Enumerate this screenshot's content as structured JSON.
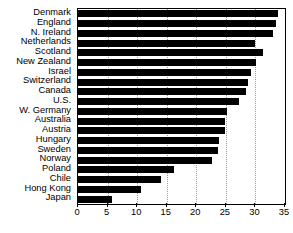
{
  "chart_data": {
    "type": "bar",
    "orientation": "horizontal",
    "title": "",
    "subtitle": "",
    "xlabel": "",
    "ylabel": "",
    "xlim": [
      0,
      35
    ],
    "ylim": null,
    "xticks": [
      0,
      5,
      10,
      15,
      20,
      25,
      30,
      35
    ],
    "xtick_labels": [
      "0",
      "5",
      "10",
      "15",
      "20",
      "25",
      "30",
      "35"
    ],
    "grid": true,
    "grid_axis": "x",
    "grid_style": "dotted",
    "legend": null,
    "legend_position": "none",
    "bar_color": "#000000",
    "categories": [
      "Denmark",
      "England",
      "N. Ireland",
      "Netherlands",
      "Scotland",
      "New Zealand",
      "Israel",
      "Switzerland",
      "Canada",
      "U.S.",
      "W. Germany",
      "Australia",
      "Austria",
      "Hungary",
      "Sweden",
      "Norway",
      "Poland",
      "Chile",
      "Hong Kong",
      "Japan"
    ],
    "values": [
      33.8,
      33.5,
      33.0,
      30.0,
      31.3,
      30.1,
      29.3,
      28.7,
      28.4,
      27.3,
      25.2,
      24.9,
      24.8,
      23.9,
      23.6,
      22.6,
      16.3,
      14.1,
      10.7,
      5.7
    ]
  },
  "colors": {
    "bar": "#000000",
    "axis": "#000000",
    "grid": "#9a9a9a",
    "background": "#ffffff",
    "text": "#000000"
  }
}
